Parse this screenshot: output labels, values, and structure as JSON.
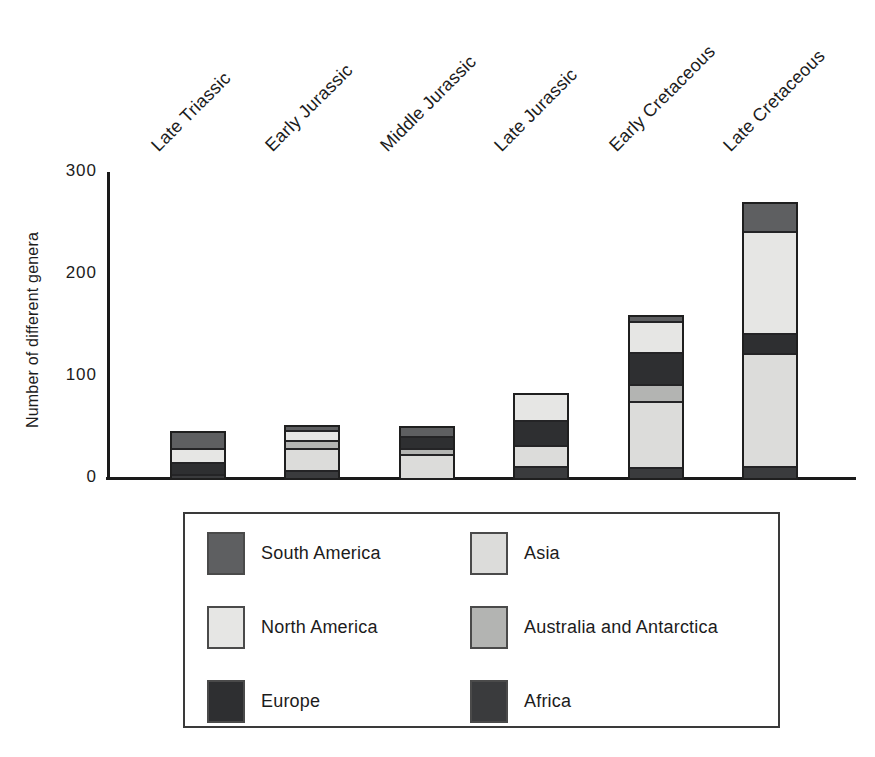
{
  "figure": {
    "y_axis_title": "Number of different genera"
  },
  "chart_data": {
    "type": "bar",
    "subtype": "stacked-vertical",
    "title": "",
    "xlabel": "",
    "ylabel": "Number of different genera",
    "ylim": [
      0,
      300
    ],
    "yticks": [
      0,
      100,
      200,
      300
    ],
    "grid": false,
    "legend_position": "bottom-box-two-columns",
    "categories": [
      "Late Triassic",
      "Early Jurassic",
      "Middle Jurassic",
      "Late Jurassic",
      "Early Cretaceous",
      "Late Cretaceous"
    ],
    "stack_order": "top-to-bottom",
    "series": [
      {
        "name": "South America",
        "color": "#5e5f61",
        "values": [
          15,
          3,
          8,
          0,
          4,
          27
        ]
      },
      {
        "name": "North America",
        "color": "#e6e6e4",
        "values": [
          13,
          10,
          0,
          24,
          30,
          100
        ]
      },
      {
        "name": "Europe",
        "color": "#2e2f31",
        "values": [
          12,
          0,
          12,
          25,
          32,
          19
        ]
      },
      {
        "name": "Australia and Antarctica",
        "color": "#b3b4b2",
        "values": [
          0,
          8,
          5,
          0,
          17,
          0
        ]
      },
      {
        "name": "Asia",
        "color": "#dcdcda",
        "values": [
          0,
          21,
          24,
          20,
          64,
          111
        ]
      },
      {
        "name": "Africa",
        "color": "#3a3b3d",
        "values": [
          4,
          8,
          0,
          12,
          11,
          12
        ]
      }
    ],
    "totals": [
      44,
      50,
      49,
      81,
      158,
      269
    ]
  },
  "legend": {
    "columns": [
      [
        {
          "label": "South America",
          "color": "#5e5f61"
        },
        {
          "label": "North America",
          "color": "#e6e6e4"
        },
        {
          "label": "Europe",
          "color": "#2e2f31"
        }
      ],
      [
        {
          "label": "Asia",
          "color": "#dcdcda"
        },
        {
          "label": "Australia and Antarctica",
          "color": "#b3b4b2"
        },
        {
          "label": "Africa",
          "color": "#3a3b3d"
        }
      ]
    ]
  },
  "colors": {
    "axis": "#1a1a1a",
    "bar_outline": "#1f1f1f",
    "text": "#1c1c1c",
    "background": "#ffffff"
  }
}
